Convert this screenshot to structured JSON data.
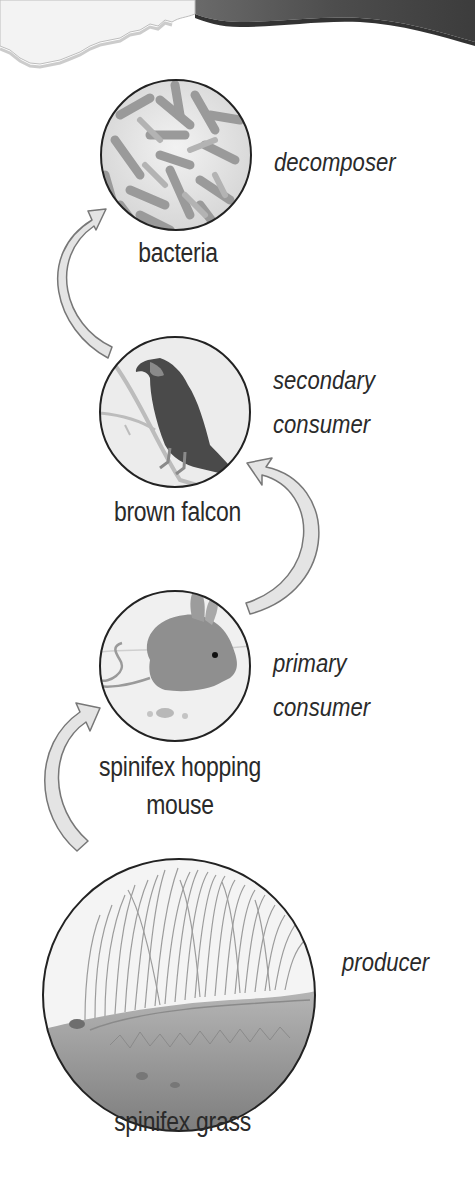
{
  "diagram": {
    "title": "",
    "type": "food chain",
    "organisms": [
      {
        "name": "bacteria",
        "role": "decomposer"
      },
      {
        "name": "brown falcon",
        "role_line1": "secondary",
        "role_line2": "consumer"
      },
      {
        "name_line1": "spinifex hopping",
        "name_line2": "mouse",
        "role_line1": "primary",
        "role_line2": "consumer"
      },
      {
        "name": "spinifex grass",
        "role": "producer"
      }
    ],
    "arrows": [
      {
        "from": "spinifex grass",
        "to": "spinifex hopping mouse"
      },
      {
        "from": "spinifex hopping mouse",
        "to": "brown falcon"
      },
      {
        "from": "brown falcon",
        "to": "bacteria"
      }
    ],
    "colors": {
      "arrow_fill": "#e4e4e4",
      "arrow_stroke": "#777777",
      "circle_stroke": "#222222",
      "header_dark": "#5a5a5a",
      "header_paper": "#f3f3f3"
    }
  }
}
